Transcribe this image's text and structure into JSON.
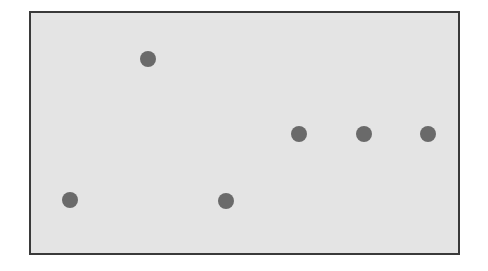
{
  "chart_data": {
    "type": "scatter",
    "title": "",
    "xlabel": "",
    "ylabel": "",
    "xlim": [
      0,
      100
    ],
    "ylim": [
      0,
      100
    ],
    "grid": false,
    "legend": null,
    "axes_visible": false,
    "series": [
      {
        "name": "points",
        "color": "#6a6a6a",
        "marker": "circle",
        "points": [
          {
            "x": 9.1,
            "y": 22.1
          },
          {
            "x": 27.4,
            "y": 80.8
          },
          {
            "x": 45.7,
            "y": 21.7
          },
          {
            "x": 62.8,
            "y": 49.6
          },
          {
            "x": 78.0,
            "y": 49.6
          },
          {
            "x": 93.0,
            "y": 49.6
          }
        ]
      }
    ]
  },
  "style": {
    "panel_background": "#e4e4e4",
    "panel_border": "#3a3a3a",
    "point_color": "#6a6a6a"
  }
}
